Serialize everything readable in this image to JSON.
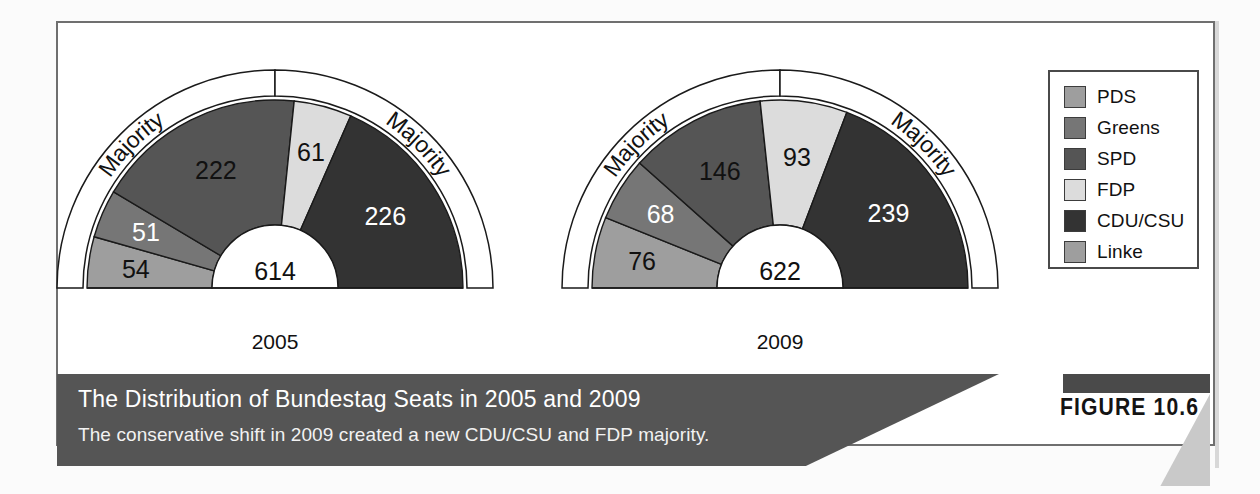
{
  "figure": {
    "number_label": "FIGURE 10.6",
    "caption_title": "The Distribution of Bundestag Seats in 2005 and 2009",
    "caption_subtitle": "The conservative shift in 2009 created a new CDU/CSU and FDP majority.",
    "majority_label": "Majority"
  },
  "colors": {
    "pds": "#9e9e9e",
    "greens": "#767676",
    "spd": "#555555",
    "fdp": "#dcdcdc",
    "cducsu": "#333333",
    "linke": "#9e9e9e",
    "caption_bar": "#555555",
    "figure_bar": "#4a4a4a",
    "frame_border": "#6f6f6f",
    "background": "#ffffff"
  },
  "legend": {
    "items": [
      {
        "label": "PDS",
        "color": "#9e9e9e",
        "text_color": "#111111"
      },
      {
        "label": "Greens",
        "color": "#767676",
        "text_color": "#ffffff"
      },
      {
        "label": "SPD",
        "color": "#555555",
        "text_color": "#111111"
      },
      {
        "label": "FDP",
        "color": "#dcdcdc",
        "text_color": "#111111"
      },
      {
        "label": "CDU/CSU",
        "color": "#333333",
        "text_color": "#ffffff"
      },
      {
        "label": "Linke",
        "color": "#9e9e9e",
        "text_color": "#111111"
      }
    ]
  },
  "chart_data": {
    "type": "pie",
    "title": "The Distribution of Bundestag Seats in 2005 and 2009",
    "subtitle": "The conservative shift in 2009 created a new CDU/CSU and FDP majority.",
    "shape": "half-donut",
    "orientation": "semicircle, left-to-right",
    "legend_position": "right",
    "grid": false,
    "charts": [
      {
        "year": "2005",
        "total": 614,
        "total_label": "614",
        "cx": 275,
        "cy": 288,
        "r_inner": 63,
        "r_outer": 188,
        "majority_band": {
          "r_inner": 192,
          "r_outer": 218,
          "threshold_seats": 308
        },
        "categories": [
          "PDS",
          "Greens",
          "SPD",
          "FDP",
          "CDU/CSU"
        ],
        "values": [
          54,
          51,
          222,
          61,
          226
        ],
        "slices": [
          {
            "party": "PDS",
            "seats": 54,
            "label": "54",
            "color": "#9e9e9e",
            "text_color": "#111111"
          },
          {
            "party": "Greens",
            "seats": 51,
            "label": "51",
            "color": "#767676",
            "text_color": "#ffffff"
          },
          {
            "party": "SPD",
            "seats": 222,
            "label": "222",
            "color": "#555555",
            "text_color": "#111111"
          },
          {
            "party": "FDP",
            "seats": 61,
            "label": "61",
            "color": "#dcdcdc",
            "text_color": "#111111"
          },
          {
            "party": "CDU/CSU",
            "seats": 226,
            "label": "226",
            "color": "#333333",
            "text_color": "#ffffff"
          }
        ],
        "majorities": [
          {
            "side": "left",
            "label": "Majority",
            "from_party": "PDS",
            "to_party": "SPD"
          },
          {
            "side": "right",
            "label": "Majority",
            "from_party": "FDP",
            "to_party": "CDU/CSU"
          }
        ]
      },
      {
        "year": "2009",
        "total": 622,
        "total_label": "622",
        "cx": 780,
        "cy": 288,
        "r_inner": 63,
        "r_outer": 188,
        "majority_band": {
          "r_inner": 192,
          "r_outer": 218,
          "threshold_seats": 312
        },
        "categories": [
          "Linke",
          "Greens",
          "SPD",
          "FDP",
          "CDU/CSU"
        ],
        "values": [
          76,
          68,
          146,
          93,
          239
        ],
        "slices": [
          {
            "party": "Linke",
            "seats": 76,
            "label": "76",
            "color": "#9e9e9e",
            "text_color": "#111111"
          },
          {
            "party": "Greens",
            "seats": 68,
            "label": "68",
            "color": "#767676",
            "text_color": "#ffffff"
          },
          {
            "party": "SPD",
            "seats": 146,
            "label": "146",
            "color": "#555555",
            "text_color": "#111111"
          },
          {
            "party": "FDP",
            "seats": 93,
            "label": "93",
            "color": "#dcdcdc",
            "text_color": "#111111"
          },
          {
            "party": "CDU/CSU",
            "seats": 239,
            "label": "239",
            "color": "#333333",
            "text_color": "#ffffff"
          }
        ],
        "majorities": [
          {
            "side": "left",
            "label": "Majority",
            "from_party": "Linke",
            "to_party": "FDP"
          },
          {
            "side": "right",
            "label": "Majority",
            "from_party": "SPD",
            "to_party": "CDU/CSU"
          }
        ]
      }
    ],
    "year_labels": [
      "2005",
      "2009"
    ]
  }
}
